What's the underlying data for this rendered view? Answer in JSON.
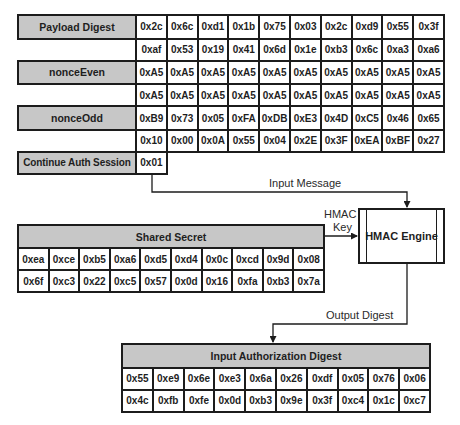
{
  "top_table": {
    "rows": [
      {
        "label": "Payload Digest",
        "values": [
          "0x2c",
          "0x6c",
          "0xd1",
          "0x1b",
          "0x75",
          "0x03",
          "0x2c",
          "0xd9",
          "0x55",
          "0x3f"
        ]
      },
      {
        "label": "",
        "values": [
          "0xaf",
          "0x53",
          "0x19",
          "0x41",
          "0x6d",
          "0x1e",
          "0xb3",
          "0x6c",
          "0xa3",
          "0xa6"
        ]
      },
      {
        "label": "nonceEven",
        "values": [
          "0xA5",
          "0xA5",
          "0xA5",
          "0xA5",
          "0xA5",
          "0xA5",
          "0xA5",
          "0xA5",
          "0xA5",
          "0xA5"
        ]
      },
      {
        "label": "",
        "values": [
          "0xA5",
          "0xA5",
          "0xA5",
          "0xA5",
          "0xA5",
          "0xA5",
          "0xA5",
          "0xA5",
          "0xA5",
          "0xA5"
        ]
      },
      {
        "label": "nonceOdd",
        "values": [
          "0xB9",
          "0x73",
          "0x05",
          "0xFA",
          "0xDB",
          "0xE3",
          "0x4D",
          "0xC5",
          "0x46",
          "0x65"
        ]
      },
      {
        "label": "",
        "values": [
          "0x10",
          "0x00",
          "0x0A",
          "0x55",
          "0x04",
          "0x2E",
          "0x3F",
          "0xEA",
          "0xBF",
          "0x27"
        ]
      },
      {
        "label": "Continue Auth Session",
        "values": [
          "0x01"
        ]
      }
    ]
  },
  "shared_secret": {
    "title": "Shared Secret",
    "rows": [
      [
        "0xea",
        "0xce",
        "0xb5",
        "0xa6",
        "0xd5",
        "0xd4",
        "0x0c",
        "0xcd",
        "0x9d",
        "0x08"
      ],
      [
        "0x6f",
        "0xc3",
        "0x22",
        "0xc5",
        "0x57",
        "0x0d",
        "0x16",
        "0xfa",
        "0xb3",
        "0x7a"
      ]
    ]
  },
  "hmac_engine": {
    "label": "HMAC Engine"
  },
  "connectors": {
    "input_message": "Input Message",
    "hmac_key_line1": "HMAC",
    "hmac_key_line2": "Key",
    "output_digest": "Output Digest"
  },
  "auth_digest": {
    "title": "Input Authorization Digest",
    "rows": [
      [
        "0x55",
        "0xe9",
        "0x6e",
        "0xe3",
        "0x6a",
        "0x26",
        "0xdf",
        "0x05",
        "0x76",
        "0x06"
      ],
      [
        "0x4c",
        "0xfb",
        "0xfe",
        "0x0d",
        "0xb3",
        "0x9e",
        "0x3f",
        "0xc4",
        "0x1c",
        "0xc7"
      ]
    ]
  },
  "colors": {
    "header_fill": "#c7c7c7",
    "border": "#1c1c1c",
    "background": "#ffffff"
  }
}
